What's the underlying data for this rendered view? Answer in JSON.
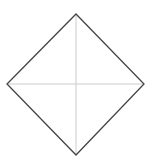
{
  "diagram": {
    "shape": "diamond",
    "vertices": {
      "top": [
        76,
        14
      ],
      "right": [
        144,
        84
      ],
      "bottom": [
        76,
        155
      ],
      "left": [
        7,
        84
      ]
    },
    "center": [
      76,
      84
    ],
    "colors": {
      "outline": "#444444",
      "crosshair": "#cccccc",
      "background": "#ffffff"
    },
    "stroke": {
      "outline_width": 1.3,
      "crosshair_width": 1
    }
  }
}
